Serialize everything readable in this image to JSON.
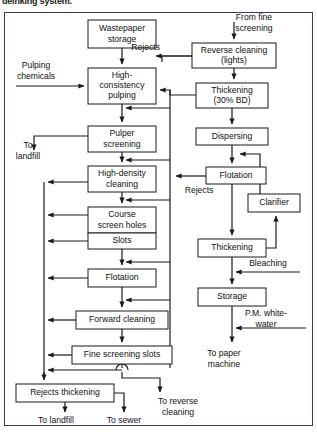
{
  "caption": "deinking system.",
  "diagram": {
    "type": "process-flowchart",
    "frame": {
      "x": 4,
      "y": 12,
      "width": 309,
      "height": 414,
      "border_color": "#3a3a6a"
    },
    "colors": {
      "line": "#1a1a1a",
      "box_fill": "#ffffff",
      "text": "#111111"
    },
    "boxes": [
      {
        "id": "wastepaper-storage",
        "label": "Wastepaper\nstorage",
        "lines": [
          "Wastepaper",
          "storage"
        ],
        "x": 88,
        "y": 20,
        "w": 68,
        "h": 28
      },
      {
        "id": "reverse-cleaning",
        "label": "Reverse cleaning\n(lights)",
        "lines": [
          "Reverse cleaning",
          "(lights)"
        ],
        "x": 192,
        "y": 43,
        "w": 84,
        "h": 25
      },
      {
        "id": "high-consistency-pulping",
        "label": "High-consistency pulping",
        "lines": [
          "High-",
          "consistency",
          "pulping"
        ],
        "x": 88,
        "y": 68,
        "w": 68,
        "h": 36
      },
      {
        "id": "thickening-30bd",
        "label": "Thickening (30% BD)",
        "lines": [
          "Thickening",
          "(30% BD)"
        ],
        "x": 196,
        "y": 83,
        "w": 72,
        "h": 25
      },
      {
        "id": "pulper-screening",
        "label": "Pulper screening",
        "lines": [
          "Pulper",
          "screening"
        ],
        "x": 88,
        "y": 126,
        "w": 68,
        "h": 26
      },
      {
        "id": "dispersing",
        "label": "Dispersing",
        "lines": [
          "Dispersing"
        ],
        "x": 196,
        "y": 128,
        "w": 72,
        "h": 17
      },
      {
        "id": "high-density-cleaning",
        "label": "High-density cleaning",
        "lines": [
          "High-density",
          "cleaning"
        ],
        "x": 88,
        "y": 166,
        "w": 68,
        "h": 26
      },
      {
        "id": "flotation-right",
        "label": "Flotation",
        "lines": [
          "Flotation"
        ],
        "x": 206,
        "y": 167,
        "w": 60,
        "h": 17
      },
      {
        "id": "clarifier",
        "label": "Clarifier",
        "lines": [
          "Clarifier"
        ],
        "x": 248,
        "y": 194,
        "w": 52,
        "h": 18
      },
      {
        "id": "course-screen-holes",
        "label": "Course screen holes",
        "lines": [
          "Course",
          "screen holes"
        ],
        "x": 88,
        "y": 207,
        "w": 68,
        "h": 26
      },
      {
        "id": "slots",
        "label": "Slots",
        "lines": [
          "Slots"
        ],
        "x": 88,
        "y": 233,
        "w": 68,
        "h": 16
      },
      {
        "id": "thickening-2",
        "label": "Thickening",
        "lines": [
          "Thickening"
        ],
        "x": 198,
        "y": 239,
        "w": 68,
        "h": 18
      },
      {
        "id": "flotation-left",
        "label": "Flotation",
        "lines": [
          "Flotation"
        ],
        "x": 88,
        "y": 269,
        "w": 68,
        "h": 18
      },
      {
        "id": "storage",
        "label": "Storage",
        "lines": [
          "Storage"
        ],
        "x": 198,
        "y": 288,
        "w": 68,
        "h": 18
      },
      {
        "id": "forward-cleaning",
        "label": "Forward cleaning",
        "lines": [
          "Forward cleaning"
        ],
        "x": 76,
        "y": 311,
        "w": 92,
        "h": 18
      },
      {
        "id": "fine-screening-slots",
        "label": "Fine screening slots",
        "lines": [
          "Fine screening slots"
        ],
        "x": 72,
        "y": 346,
        "w": 100,
        "h": 18
      },
      {
        "id": "rejects-thickening",
        "label": "Rejects thickening",
        "lines": [
          "Rejects thickening"
        ],
        "x": 16,
        "y": 384,
        "w": 98,
        "h": 18
      }
    ],
    "free_labels": [
      {
        "id": "from-fine-screening",
        "lines": [
          "From fine",
          "screening"
        ],
        "x": 240,
        "y": 18,
        "anchor": "middle"
      },
      {
        "id": "rejects-top",
        "lines": [
          "Rejects"
        ],
        "x": 185,
        "y": 56,
        "anchor": "end"
      },
      {
        "id": "pulping-chemicals",
        "lines": [
          "Pulping",
          "chemicals"
        ],
        "x": 35,
        "y": 70,
        "anchor": "middle"
      },
      {
        "id": "to-landfill-left",
        "lines": [
          "To",
          "landfill"
        ],
        "x": 30,
        "y": 148,
        "anchor": "middle"
      },
      {
        "id": "rejects-flotation",
        "lines": [
          "Rejects"
        ],
        "x": 198,
        "y": 190,
        "anchor": "middle"
      },
      {
        "id": "bleaching",
        "lines": [
          "Bleaching"
        ],
        "x": 238,
        "y": 266,
        "anchor": "middle"
      },
      {
        "id": "pm-whitewater",
        "lines": [
          "P.M. white-",
          "water"
        ],
        "x": 252,
        "y": 318,
        "anchor": "middle"
      },
      {
        "id": "to-paper-machine",
        "lines": [
          "To paper",
          "machine"
        ],
        "x": 222,
        "y": 356,
        "anchor": "middle"
      },
      {
        "id": "to-reverse-cleaning",
        "lines": [
          "To reverse",
          "cleaning"
        ],
        "x": 178,
        "y": 396,
        "anchor": "middle"
      },
      {
        "id": "to-landfill-bottom",
        "lines": [
          "To landfill"
        ],
        "x": 48,
        "y": 420,
        "anchor": "middle"
      },
      {
        "id": "to-sewer",
        "lines": [
          "To sewer"
        ],
        "x": 110,
        "y": 420,
        "anchor": "middle"
      }
    ],
    "flow_edges": [
      "wastepaper-storage -> high-consistency-pulping",
      "pulping-chemicals -> high-consistency-pulping",
      "from-fine-screening -> reverse-cleaning",
      "reverse-cleaning -> rejects (to high-consistency-pulping)",
      "reverse-cleaning -> thickening-30bd",
      "thickening-30bd -> high-consistency-pulping (recycle)",
      "thickening-30bd -> dispersing",
      "high-consistency-pulping -> pulper-screening",
      "pulper-screening -> to-landfill-left",
      "pulper-screening -> high-density-cleaning",
      "high-density-cleaning -> course-screen-holes",
      "course-screen-holes -> slots",
      "slots -> flotation-left",
      "flotation-left -> forward-cleaning",
      "forward-cleaning -> fine-screening-slots",
      "fine-screening-slots -> rejects-thickening",
      "rejects-thickening -> to-landfill-bottom",
      "rejects-thickening -> to-sewer",
      "fine-screening-slots -> to-reverse-cleaning",
      "dispersing -> flotation-right",
      "flotation-right -> rejects",
      "flotation-right -> thickening-2",
      "thickening-2 -> clarifier",
      "clarifier -> dispersing",
      "bleaching -> storage line",
      "thickening-2 -> storage",
      "storage -> to-paper-machine",
      "pm-whitewater -> storage outlet"
    ]
  }
}
